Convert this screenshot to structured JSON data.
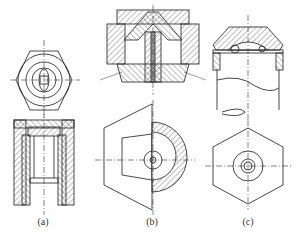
{
  "figure": {
    "views": [
      {
        "id": "a",
        "label": "(a)",
        "label_x": 43,
        "label_y": 216
      },
      {
        "id": "b",
        "label": "(b)",
        "label_x": 152,
        "label_y": 216
      },
      {
        "id": "c",
        "label": "(c)",
        "label_x": 248,
        "label_y": 216
      }
    ],
    "colors": {
      "line": "#333333",
      "background": "#ffffff"
    }
  }
}
